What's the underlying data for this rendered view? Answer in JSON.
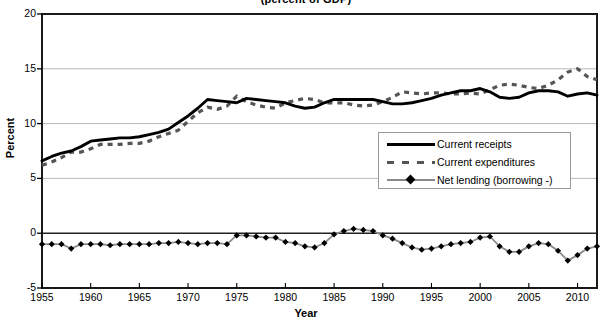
{
  "chart_data": {
    "type": "line",
    "title": "(percent of GDP)",
    "xlabel": "Year",
    "ylabel": "Percent",
    "xlim": [
      1955,
      2012
    ],
    "ylim": [
      -5,
      20
    ],
    "ytick_step": 5,
    "xtick_step": 5,
    "grid": true,
    "legend_position": "inside-right-middle",
    "yticks": [
      "20",
      "15",
      "10",
      "5",
      "0",
      "-5"
    ],
    "xticks": [
      "1955",
      "1960",
      "1965",
      "1970",
      "1975",
      "1980",
      "1985",
      "1990",
      "1995",
      "2000",
      "2005",
      "2010"
    ],
    "x": [
      1955,
      1956,
      1957,
      1958,
      1959,
      1960,
      1961,
      1962,
      1963,
      1964,
      1965,
      1966,
      1967,
      1968,
      1969,
      1970,
      1971,
      1972,
      1973,
      1974,
      1975,
      1976,
      1977,
      1978,
      1979,
      1980,
      1981,
      1982,
      1983,
      1984,
      1985,
      1986,
      1987,
      1988,
      1989,
      1990,
      1991,
      1992,
      1993,
      1994,
      1995,
      1996,
      1997,
      1998,
      1999,
      2000,
      2001,
      2002,
      2003,
      2004,
      2005,
      2006,
      2007,
      2008,
      2009,
      2010,
      2011,
      2012
    ],
    "series": [
      {
        "name": "Current receipts",
        "style": "solid-black-thick",
        "color": "#000000",
        "values": [
          6.6,
          7.0,
          7.3,
          7.5,
          7.9,
          8.4,
          8.5,
          8.6,
          8.7,
          8.7,
          8.8,
          9.0,
          9.2,
          9.5,
          10.1,
          10.7,
          11.4,
          12.2,
          12.1,
          12.0,
          11.9,
          12.3,
          12.2,
          12.1,
          12.0,
          11.9,
          11.6,
          11.4,
          11.5,
          11.9,
          12.2,
          12.2,
          12.2,
          12.2,
          12.2,
          12.0,
          11.8,
          11.8,
          11.9,
          12.1,
          12.3,
          12.6,
          12.8,
          13.0,
          13.0,
          13.2,
          12.9,
          12.4,
          12.3,
          12.4,
          12.8,
          13.0,
          13.0,
          12.9,
          12.5,
          12.7,
          12.8,
          12.6
        ]
      },
      {
        "name": "Current expenditures",
        "style": "dashed-gray",
        "color": "#555555",
        "values": [
          6.2,
          6.5,
          6.9,
          7.4,
          7.4,
          7.7,
          8.1,
          8.1,
          8.1,
          8.2,
          8.2,
          8.4,
          8.8,
          9.1,
          9.4,
          10.2,
          11.0,
          11.5,
          11.3,
          11.6,
          12.5,
          12.0,
          11.7,
          11.5,
          11.4,
          11.9,
          12.1,
          12.3,
          12.2,
          11.9,
          11.9,
          11.9,
          11.7,
          11.6,
          11.7,
          12.0,
          12.4,
          12.9,
          12.8,
          12.7,
          12.8,
          12.8,
          12.7,
          12.7,
          12.8,
          12.7,
          13.1,
          13.5,
          13.6,
          13.5,
          13.3,
          13.2,
          13.5,
          14.0,
          14.7,
          15.0,
          14.3,
          14.0
        ]
      },
      {
        "name": "Net lending (borrowing -)",
        "style": "gray-line-diamond-markers",
        "color": "#8a8a8a",
        "marker_color": "#000000",
        "values": [
          -1.0,
          -1.0,
          -1.0,
          -1.4,
          -1.0,
          -1.0,
          -1.0,
          -1.1,
          -1.0,
          -1.0,
          -1.0,
          -1.0,
          -0.9,
          -0.9,
          -0.8,
          -0.9,
          -1.0,
          -0.9,
          -0.9,
          -1.0,
          -0.2,
          -0.2,
          -0.3,
          -0.4,
          -0.4,
          -0.8,
          -0.9,
          -1.2,
          -1.3,
          -0.9,
          -0.1,
          0.2,
          0.4,
          0.3,
          0.2,
          -0.2,
          -0.5,
          -0.9,
          -1.3,
          -1.5,
          -1.4,
          -1.2,
          -1.0,
          -0.9,
          -0.8,
          -0.4,
          -0.3,
          -1.2,
          -1.7,
          -1.7,
          -1.2,
          -0.9,
          -1.0,
          -1.6,
          -2.5,
          -2.0,
          -1.4,
          -1.2
        ]
      }
    ]
  },
  "legend": {
    "items": [
      {
        "label": "Current receipts"
      },
      {
        "label": "Current expenditures"
      },
      {
        "label": "Net lending (borrowing -)"
      }
    ]
  }
}
